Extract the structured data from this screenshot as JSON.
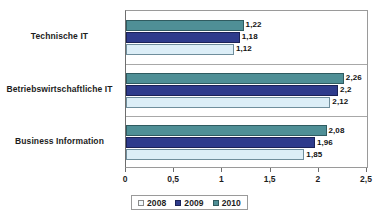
{
  "chart_data": {
    "type": "bar",
    "orientation": "horizontal",
    "title": "",
    "xlabel": "",
    "ylabel": "",
    "xlim": [
      0,
      2.5
    ],
    "xticks": [
      "0",
      "0,5",
      "1",
      "1,5",
      "2",
      "2,5"
    ],
    "xtick_values": [
      0,
      0.5,
      1,
      1.5,
      2,
      2.5
    ],
    "grid": false,
    "legend_position": "bottom",
    "decimal_separator": ",",
    "categories": [
      "Technische IT",
      "Betriebswirtschaftliche IT",
      "Business Information"
    ],
    "series": [
      {
        "name": "2008",
        "color": "#dceef7",
        "values": [
          1.12,
          2.12,
          1.85
        ],
        "labels": [
          "1,12",
          "2,12",
          "1,85"
        ]
      },
      {
        "name": "2009",
        "color": "#2e3b8c",
        "values": [
          1.18,
          2.2,
          1.96
        ],
        "labels": [
          "1,18",
          "2,2",
          "1,96"
        ]
      },
      {
        "name": "2010",
        "color": "#4f8f96",
        "values": [
          1.22,
          2.26,
          2.08
        ],
        "labels": [
          "1,22",
          "2,26",
          "2,08"
        ]
      }
    ]
  },
  "legend": {
    "items": [
      {
        "label": "2008",
        "swatch_class": "y2008"
      },
      {
        "label": "2009",
        "swatch_class": "y2009"
      },
      {
        "label": "2010",
        "swatch_class": "y2010"
      }
    ]
  }
}
